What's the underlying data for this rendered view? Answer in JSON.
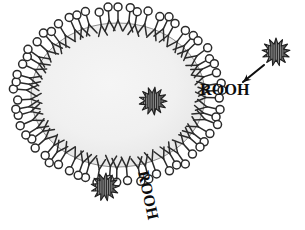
{
  "figure": {
    "name": "liposome-lipid-peroxide-diagram",
    "background_color": "#ffffff",
    "ink_color": "#2b2b2b",
    "text_color": "#0d0d0d"
  },
  "vesicle": {
    "name": "liposome",
    "center_x": 118,
    "center_y": 95,
    "radius_x": 103,
    "radius_y": 87,
    "interior_fill": "#f1f1f1",
    "interior_fill_edge": "#e7e7e7",
    "membrane_line_color": "#3a3a3a",
    "lipid_count": 62,
    "lipid_head_radius": 4.0,
    "lipid_head_fill": "#ffffff",
    "lipid_tail_length": 17
  },
  "starbursts": [
    {
      "name": "starburst-interior",
      "label": "ROOH molecule inside vesicle lumen",
      "center_x": 153,
      "center_y": 101,
      "outer_radius": 14,
      "inner_radius": 8,
      "points": 13,
      "fill": "#8a8a8a",
      "stroke": "#1f1f1f",
      "rotation": 8
    },
    {
      "name": "starburst-membrane",
      "label": "ROOH molecule embedded in bilayer",
      "center_x": 105,
      "center_y": 187,
      "outer_radius": 14,
      "inner_radius": 8,
      "points": 13,
      "fill": "#8a8a8a",
      "stroke": "#1f1f1f",
      "rotation": 4
    },
    {
      "name": "starburst-free",
      "label": "free ROOH molecule outside vesicle",
      "center_x": 276,
      "center_y": 52,
      "outer_radius": 14,
      "inner_radius": 8,
      "points": 13,
      "fill": "#8a8a8a",
      "stroke": "#1f1f1f",
      "rotation": 0
    }
  ],
  "arrow": {
    "name": "incorporation-arrow",
    "from_x": 264,
    "from_y": 65,
    "to_x": 243,
    "to_y": 82,
    "color": "#0f0f0f",
    "stroke_width": 2.1,
    "head_size": 7
  },
  "labels": [
    {
      "name": "rooh-label-right",
      "text": "ROOH",
      "x": 200,
      "y": 95,
      "font_size": 16,
      "rotation": 0,
      "anchor": "start"
    },
    {
      "name": "rooh-label-bottom",
      "text": "ROOH",
      "x": 138,
      "y": 172,
      "font_size": 16,
      "rotation": 78,
      "anchor": "start"
    }
  ]
}
